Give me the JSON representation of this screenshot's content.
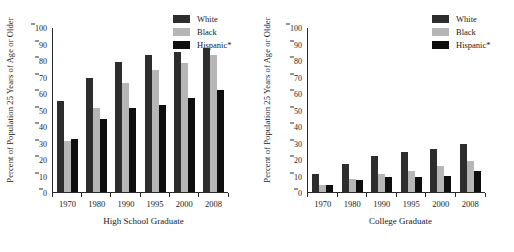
{
  "chart_data": [
    {
      "type": "bar",
      "title": "",
      "xlabel": "High School Graduate",
      "ylabel": "Percent of Population 25 Years of Age or Older",
      "categories": [
        "1970",
        "1980",
        "1990",
        "1995",
        "2000",
        "2008"
      ],
      "ylim": [
        0,
        100
      ],
      "yticks": [
        0,
        10,
        20,
        30,
        40,
        50,
        60,
        70,
        80,
        90,
        100
      ],
      "grid": false,
      "legend_position": "top-right",
      "series": [
        {
          "name": "White",
          "color": "#2d2d2d",
          "values": [
            55,
            69,
            79,
            83,
            85,
            87
          ]
        },
        {
          "name": "Black",
          "color": "#b6b6b6",
          "values": [
            31,
            51,
            66,
            74,
            78,
            83
          ]
        },
        {
          "name": "Hispanic*",
          "color": "#0e0e0e",
          "values": [
            32,
            44,
            51,
            53,
            57,
            62
          ]
        }
      ]
    },
    {
      "type": "bar",
      "title": "",
      "xlabel": "College Graduate",
      "ylabel": "Percent of Population 25 Years of Age or Older",
      "categories": [
        "1970",
        "1980",
        "1990",
        "1995",
        "2000",
        "2008"
      ],
      "ylim": [
        0,
        100
      ],
      "yticks": [
        0,
        10,
        20,
        30,
        40,
        50,
        60,
        70,
        80,
        90,
        100
      ],
      "grid": false,
      "legend_position": "top-right",
      "series": [
        {
          "name": "White",
          "color": "#2d2d2d",
          "values": [
            11,
            17,
            22,
            24,
            26,
            29
          ]
        },
        {
          "name": "Black",
          "color": "#b6b6b6",
          "values": [
            4,
            8,
            11,
            13,
            16,
            19
          ]
        },
        {
          "name": "Hispanic*",
          "color": "#0e0e0e",
          "values": [
            4,
            7,
            9,
            9,
            10,
            13
          ]
        }
      ]
    }
  ]
}
